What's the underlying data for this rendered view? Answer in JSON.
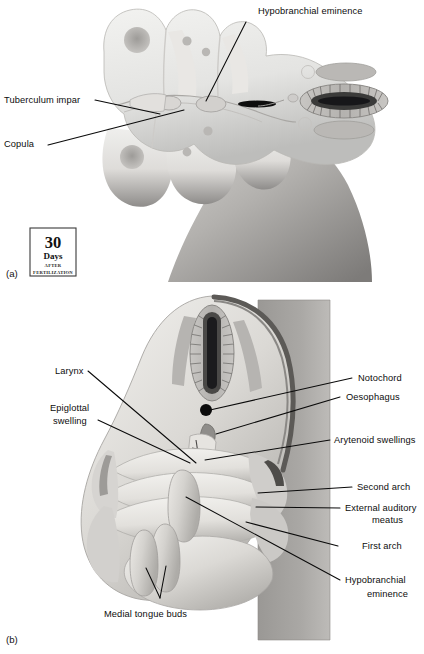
{
  "figure": {
    "type": "anatomical-illustration",
    "background_color": "#ffffff",
    "line_color": "#0a0a0a"
  },
  "panel_a": {
    "id": "(a)",
    "labels": [
      {
        "key": "hypobranchial_eminence",
        "text": "Hypobranchial eminence"
      },
      {
        "key": "tuberculum_impar",
        "text": "Tuberculum impar"
      },
      {
        "key": "copula",
        "text": "Copula"
      }
    ],
    "badge": {
      "number": "30",
      "unit": "Days",
      "line1": "AFTER",
      "line2": "FERTILIZATION"
    }
  },
  "panel_b": {
    "id": "(b)",
    "labels": [
      {
        "key": "notochord",
        "text": "Notochord"
      },
      {
        "key": "oesophagus",
        "text": "Oesophagus"
      },
      {
        "key": "arytenoid_swellings",
        "text": "Arytenoid swellings"
      },
      {
        "key": "second_arch",
        "text": "Second arch"
      },
      {
        "key": "external_auditory_meatus_line1",
        "text": "External auditory"
      },
      {
        "key": "external_auditory_meatus_line2",
        "text": "meatus"
      },
      {
        "key": "first_arch",
        "text": "First arch"
      },
      {
        "key": "hypobranchial_eminence_line1",
        "text": "Hypobranchial"
      },
      {
        "key": "hypobranchial_eminence_line2",
        "text": "eminence"
      },
      {
        "key": "larynx",
        "text": "Larynx"
      },
      {
        "key": "epiglottal_swelling_line1",
        "text": "Epiglottal"
      },
      {
        "key": "epiglottal_swelling_line2",
        "text": "swelling"
      },
      {
        "key": "medial_tongue_buds",
        "text": "Medial tongue buds"
      }
    ]
  }
}
